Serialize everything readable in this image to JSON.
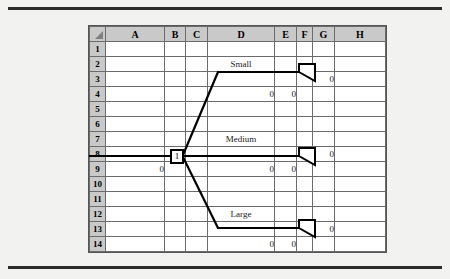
{
  "figure": {
    "kind": "spreadsheet-decision-tree"
  },
  "spreadsheet": {
    "corner_icon": "select-all-triangle-icon",
    "columns": [
      "A",
      "B",
      "C",
      "D",
      "E",
      "F",
      "G",
      "H"
    ],
    "rows": [
      "1",
      "2",
      "3",
      "4",
      "5",
      "6",
      "7",
      "8",
      "9",
      "10",
      "11",
      "12",
      "13",
      "14"
    ],
    "cells": {
      "r2": {
        "D": "Small"
      },
      "r3": {
        "G": "0"
      },
      "r4": {
        "D": "0",
        "E": "0"
      },
      "r7": {
        "D": "Medium"
      },
      "r8": {
        "B": "1",
        "G": "0"
      },
      "r9": {
        "A": "0",
        "D": "0",
        "E": "0"
      },
      "r12": {
        "D": "Large"
      },
      "r13": {
        "G": "0"
      },
      "r14": {
        "D": "0",
        "E": "0"
      }
    }
  },
  "tree": {
    "root_node_label": "1",
    "branches": [
      {
        "label": "Small",
        "payoff": "0",
        "prob": "0",
        "value": "0"
      },
      {
        "label": "Medium",
        "payoff": "0",
        "prob": "0",
        "value": "0"
      },
      {
        "label": "Large",
        "payoff": "0",
        "prob": "0",
        "value": "0"
      }
    ],
    "root_value": "0",
    "endpoint_marker": "terminal-triangle-icon"
  },
  "colors": {
    "page_background": "#f2f2f0",
    "rule": "#2b2b2b",
    "grid_line": "#6b6b6b",
    "header_fill": "#c9c9c9",
    "ink": "#000000"
  }
}
